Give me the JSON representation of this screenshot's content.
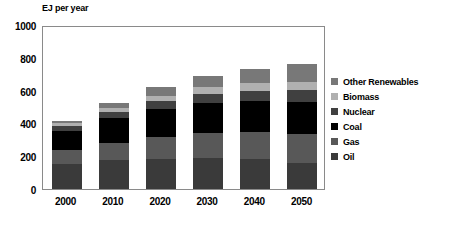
{
  "chart_data": {
    "type": "bar",
    "subtype": "stacked-column",
    "title": "EJ per year",
    "xlabel": "",
    "ylabel": "",
    "ylim": [
      0,
      1000
    ],
    "yticks": [
      0,
      200,
      400,
      600,
      800,
      1000
    ],
    "ytick_labels": [
      "0",
      "200",
      "400",
      "600",
      "800",
      "1000"
    ],
    "grid": false,
    "legend_position": "right",
    "categories": [
      "2000",
      "2010",
      "2020",
      "2030",
      "2040",
      "2050"
    ],
    "stack_order_bottom_to_top": [
      "Oil",
      "Gas",
      "Coal",
      "Nuclear",
      "Biomass",
      "Other Renewables"
    ],
    "series": [
      {
        "name": "Oil",
        "color": "#3a3a3a",
        "values": [
          150,
          175,
          185,
          190,
          180,
          160
        ]
      },
      {
        "name": "Gas",
        "color": "#585858",
        "values": [
          85,
          105,
          130,
          150,
          165,
          175
        ]
      },
      {
        "name": "Coal",
        "color": "#000000",
        "values": [
          120,
          155,
          175,
          185,
          190,
          195
        ]
      },
      {
        "name": "Nuclear",
        "color": "#404040",
        "values": [
          30,
          35,
          45,
          55,
          65,
          75
        ]
      },
      {
        "name": "Biomass",
        "color": "#b0b0b0",
        "values": [
          20,
          25,
          35,
          40,
          45,
          50
        ]
      },
      {
        "name": "Other Renewables",
        "color": "#787878",
        "values": [
          10,
          30,
          55,
          70,
          85,
          110
        ]
      }
    ],
    "totals": [
      415,
      525,
      625,
      690,
      730,
      765
    ]
  },
  "legend": {
    "items": [
      {
        "label": "Other Renewables",
        "color": "#787878"
      },
      {
        "label": "Biomass",
        "color": "#b0b0b0"
      },
      {
        "label": "Nuclear",
        "color": "#404040"
      },
      {
        "label": "Coal",
        "color": "#000000"
      },
      {
        "label": "Gas",
        "color": "#585858"
      },
      {
        "label": "Oil",
        "color": "#3a3a3a"
      }
    ]
  }
}
